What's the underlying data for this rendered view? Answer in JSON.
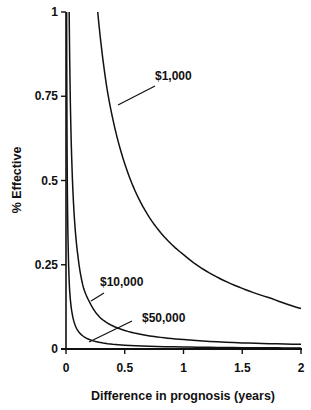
{
  "chart_data": {
    "type": "line",
    "title": "",
    "xlabel": "Difference in prognosis (years)",
    "ylabel": "% Effective",
    "xlim": [
      0,
      2
    ],
    "ylim": [
      0,
      1
    ],
    "x_ticks": [
      "0",
      "0.5",
      "1",
      "1.5",
      "2"
    ],
    "y_ticks": [
      "0",
      "0.25",
      "0.5",
      "0.75",
      "1"
    ],
    "grid": false,
    "legend": "inline labels with leader lines",
    "series": [
      {
        "name": "$1,000",
        "x": [
          0.27,
          0.3,
          0.35,
          0.4,
          0.5,
          0.6,
          0.75,
          1.0,
          1.25,
          1.5,
          1.75,
          2.0
        ],
        "values": [
          1.0,
          0.9,
          0.77,
          0.68,
          0.55,
          0.46,
          0.37,
          0.28,
          0.22,
          0.18,
          0.15,
          0.12
        ]
      },
      {
        "name": "$10,000",
        "x": [
          0.027,
          0.03,
          0.04,
          0.05,
          0.075,
          0.1,
          0.15,
          0.2,
          0.3,
          0.5,
          0.75,
          1.0,
          1.5,
          2.0
        ],
        "values": [
          1.0,
          0.9,
          0.68,
          0.55,
          0.37,
          0.28,
          0.18,
          0.14,
          0.09,
          0.055,
          0.037,
          0.028,
          0.018,
          0.014
        ]
      },
      {
        "name": "$50,000",
        "x": [
          0.0055,
          0.007,
          0.01,
          0.015,
          0.02,
          0.03,
          0.05,
          0.1,
          0.2,
          0.5,
          1.0,
          1.5,
          2.0
        ],
        "values": [
          1.0,
          0.78,
          0.55,
          0.37,
          0.28,
          0.18,
          0.11,
          0.055,
          0.028,
          0.011,
          0.006,
          0.004,
          0.003
        ]
      }
    ],
    "annotations": [
      {
        "text": "$1,000",
        "x": 0.72,
        "y": 0.79
      },
      {
        "text": "$10,000",
        "x": 0.3,
        "y": 0.14
      },
      {
        "text": "$50,000",
        "x": 0.65,
        "y": 0.07
      }
    ]
  }
}
